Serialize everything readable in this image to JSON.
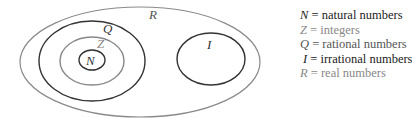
{
  "diagram": {
    "colors": {
      "dark": "#333333",
      "gray": "#888888"
    },
    "sets": [
      {
        "symbol": "R",
        "name": "real numbers",
        "tone": "gray"
      },
      {
        "symbol": "Q",
        "name": "rational numbers",
        "tone": "dark"
      },
      {
        "symbol": "Z",
        "name": "integers",
        "tone": "gray"
      },
      {
        "symbol": "N",
        "name": "natural numbers",
        "tone": "dark"
      },
      {
        "symbol": "I",
        "name": "irrational numbers",
        "tone": "dark"
      }
    ]
  },
  "legend": [
    {
      "symbol": "N",
      "eq": " = ",
      "text": "natural numbers",
      "tone": "dark"
    },
    {
      "symbol": "Z",
      "eq": " = ",
      "text": "integers",
      "tone": "gray"
    },
    {
      "symbol": "Q",
      "eq": " = ",
      "text": "rational numbers",
      "tone": "gray"
    },
    {
      "symbol": "I",
      "eq": " = ",
      "text": "irrational numbers",
      "tone": "dark"
    },
    {
      "symbol": "R",
      "eq": " = ",
      "text": "real numbers",
      "tone": "gray"
    }
  ]
}
